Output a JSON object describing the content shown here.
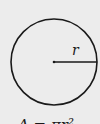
{
  "diagram": {
    "radius_label": "r",
    "formula": "A = πr²",
    "colors": {
      "background": "#ececec",
      "stroke": "#1a1a1a"
    }
  }
}
